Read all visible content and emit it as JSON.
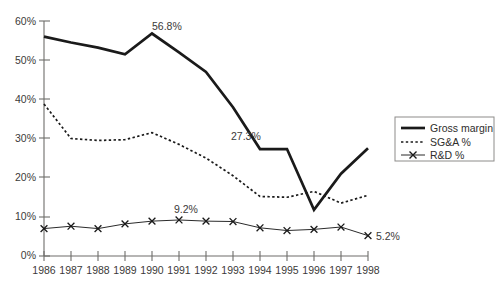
{
  "chart_data": {
    "type": "line",
    "title": "",
    "xlabel": "",
    "ylabel": "",
    "grid": false,
    "legend_position": "right",
    "categories": [
      "1986",
      "1987",
      "1988",
      "1989",
      "1990",
      "1991",
      "1992",
      "1993",
      "1994",
      "1995",
      "1996",
      "1997",
      "1998"
    ],
    "x": [
      1986,
      1987,
      1988,
      1989,
      1990,
      1991,
      1992,
      1993,
      1994,
      1995,
      1996,
      1997,
      1998
    ],
    "ylim": [
      0,
      60
    ],
    "ytick_labels": [
      "0%",
      "10%",
      "20%",
      "30%",
      "40%",
      "50%",
      "60%"
    ],
    "ytick_values": [
      0,
      10,
      20,
      30,
      40,
      50,
      60
    ],
    "series": [
      {
        "name": "Gross margin",
        "style": "solid",
        "values": [
          56.0,
          54.5,
          53.2,
          51.5,
          56.8,
          52.0,
          47.0,
          38.0,
          27.3,
          27.3,
          11.8,
          21.0,
          27.5
        ]
      },
      {
        "name": "SG&A %",
        "style": "dotted",
        "values": [
          38.8,
          30.0,
          29.5,
          29.7,
          31.5,
          28.5,
          25.0,
          20.5,
          15.2,
          15.0,
          16.5,
          13.5,
          15.5
        ]
      },
      {
        "name": "R&D %",
        "style": "solid-x",
        "values": [
          7.0,
          7.6,
          7.0,
          8.2,
          8.9,
          9.2,
          8.9,
          8.8,
          7.2,
          6.5,
          6.8,
          7.4,
          5.2
        ]
      }
    ],
    "annotations": [
      {
        "text": "56.8%",
        "series": "Gross margin",
        "x": 1990,
        "value": 56.8
      },
      {
        "text": "27.3%",
        "series": "Gross margin",
        "x": 1994,
        "value": 27.3
      },
      {
        "text": "9.2%",
        "series": "R&D %",
        "x": 1991,
        "value": 9.2
      },
      {
        "text": "5.2%",
        "series": "R&D %",
        "x": 1998,
        "value": 5.2
      }
    ],
    "legend": [
      {
        "label": "Gross margin",
        "marker": "solid-line"
      },
      {
        "label": "SG&A %",
        "marker": "dotted-line"
      },
      {
        "label": "R&D %",
        "marker": "x-line"
      }
    ],
    "colors": {
      "series_line": "#1a1a1a",
      "axis": "#6e6d6b",
      "text": "#3b3a39",
      "background": "#ffffff"
    }
  }
}
